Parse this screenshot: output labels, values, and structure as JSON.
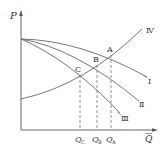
{
  "diagram": {
    "type": "pump-pipeline characteristic curves",
    "axes": {
      "y_label": "P",
      "x_label": "Q"
    },
    "curves": [
      {
        "id": "I",
        "label": "Ⅰ"
      },
      {
        "id": "II",
        "label": "Ⅱ"
      },
      {
        "id": "III",
        "label": "Ⅲ"
      },
      {
        "id": "IV",
        "label": "Ⅳ"
      }
    ],
    "points": [
      {
        "id": "A",
        "label": "A"
      },
      {
        "id": "B",
        "label": "B"
      },
      {
        "id": "C",
        "label": "C"
      }
    ],
    "x_ticks": [
      {
        "main": "Q",
        "sub": "C"
      },
      {
        "main": "Q",
        "sub": "B"
      },
      {
        "main": "Q",
        "sub": "A"
      }
    ]
  },
  "colors": {
    "line": "#555555",
    "text": "#333333",
    "background": "#ffffff"
  }
}
